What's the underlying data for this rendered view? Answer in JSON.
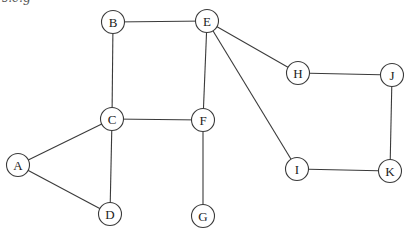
{
  "caption_fragment": "s.e.g",
  "style": {
    "stroke": "#3a3a3a",
    "fill": "#ffffff",
    "text": "#222222"
  },
  "graph": {
    "node_radius": 11.5,
    "nodes": [
      {
        "id": "A",
        "label": "A",
        "x": 18,
        "y": 165
      },
      {
        "id": "B",
        "label": "B",
        "x": 113,
        "y": 22
      },
      {
        "id": "C",
        "label": "C",
        "x": 112,
        "y": 119
      },
      {
        "id": "D",
        "label": "D",
        "x": 110,
        "y": 214
      },
      {
        "id": "E",
        "label": "E",
        "x": 207,
        "y": 21
      },
      {
        "id": "F",
        "label": "F",
        "x": 203,
        "y": 120
      },
      {
        "id": "G",
        "label": "G",
        "x": 203,
        "y": 216
      },
      {
        "id": "H",
        "label": "H",
        "x": 298,
        "y": 73
      },
      {
        "id": "I",
        "label": "I",
        "x": 297,
        "y": 169
      },
      {
        "id": "J",
        "label": "J",
        "x": 392,
        "y": 75
      },
      {
        "id": "K",
        "label": "K",
        "x": 390,
        "y": 171
      }
    ],
    "edges": [
      [
        "B",
        "E"
      ],
      [
        "B",
        "C"
      ],
      [
        "C",
        "F"
      ],
      [
        "C",
        "A"
      ],
      [
        "C",
        "D"
      ],
      [
        "A",
        "D"
      ],
      [
        "E",
        "F"
      ],
      [
        "E",
        "H"
      ],
      [
        "E",
        "I"
      ],
      [
        "F",
        "G"
      ],
      [
        "H",
        "J"
      ],
      [
        "J",
        "K"
      ],
      [
        "I",
        "K"
      ]
    ]
  }
}
